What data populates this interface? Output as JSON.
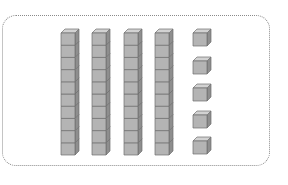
{
  "diagram": {
    "tens_rods": 4,
    "cubes_per_rod": 10,
    "units": 5,
    "represented_value": 45,
    "colors": {
      "front": "#b4b4b4",
      "top": "#d2d2d2",
      "side": "#8e8e8e",
      "outline": "#6e6e6e",
      "frame": "#8a8a8a"
    },
    "rod_x": [
      61,
      92,
      124,
      155
    ],
    "rod_top_y": 33,
    "cube_size": 12.2,
    "depth": 4,
    "unit_x": 193,
    "unit_y": [
      33,
      61,
      88,
      115,
      141
    ],
    "unit_size": 13
  }
}
